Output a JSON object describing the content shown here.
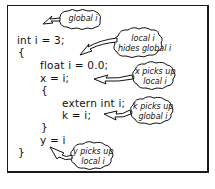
{
  "diagram": {
    "code_lines": [
      {
        "text": "int i = 3;",
        "indent": 0
      },
      {
        "text": "{",
        "indent": 0
      },
      {
        "text": "float i = 0.0;",
        "indent": 1
      },
      {
        "text": "x = i;",
        "indent": 1
      },
      {
        "text": "{",
        "indent": 1
      },
      {
        "text": "extern int i;",
        "indent": 2
      },
      {
        "text": "k = i;",
        "indent": 2
      },
      {
        "text": "}",
        "indent": 1
      },
      {
        "text": "y = i",
        "indent": 1
      },
      {
        "text": "}",
        "indent": 0
      }
    ],
    "callouts": [
      {
        "line1": "global i",
        "line2": "",
        "points_to": "int i = 3;"
      },
      {
        "line1": "local i",
        "line2": "hides global i",
        "points_to": "float i = 0.0;"
      },
      {
        "line1": "x picks up",
        "line2": "local i",
        "points_to": "x = i;"
      },
      {
        "line1": "k picks up",
        "line2": "global i",
        "points_to": "k = i;"
      },
      {
        "line1": "y picks up",
        "line2": "local i",
        "points_to": "y = i"
      }
    ],
    "colors": {
      "ink": "#111111",
      "background": "#ffffff"
    }
  }
}
